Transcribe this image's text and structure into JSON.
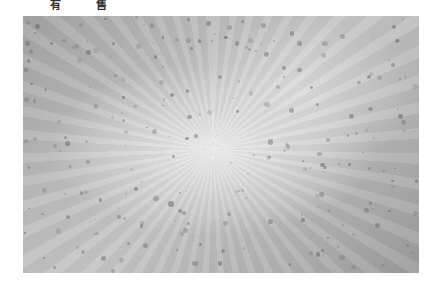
{
  "caption": {
    "chars": [
      "有",
      "售"
    ]
  },
  "photo": {
    "description": "grayscale textured surface with scattered dark specks radiating from center",
    "colors": {
      "center": "#eeeeee",
      "edge": "#9c9c9c",
      "speck": "#5a5a5a"
    }
  }
}
